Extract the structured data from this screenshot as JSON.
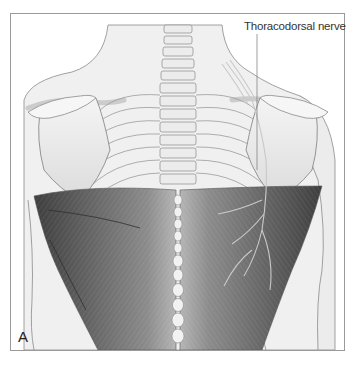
{
  "figure": {
    "panel_label": "A",
    "callouts": [
      {
        "label": "Thoracodorsal nerve"
      }
    ],
    "colors": {
      "frame": "#9a9a9a",
      "muscle_dark": "#4a4a4a",
      "muscle_mid": "#7a7a7a",
      "bone": "#e6e6e6",
      "skin": "#efefef",
      "outline": "#8a8a8a",
      "label_text": "#333333"
    }
  }
}
